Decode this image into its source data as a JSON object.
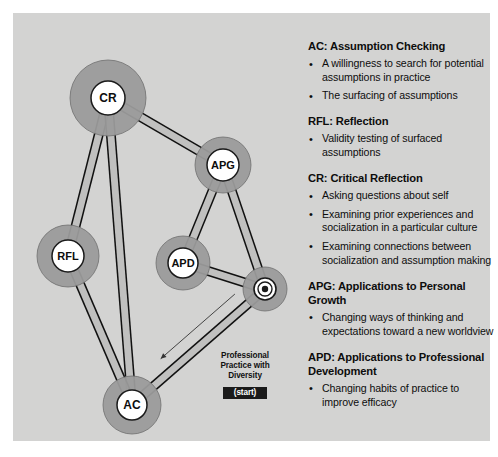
{
  "canvas": {
    "background": "#d3d3d2",
    "page_background": "#ffffff"
  },
  "colors": {
    "halo": "#9b9b9b",
    "node_fill": "#ffffff",
    "node_stroke": "#1a1a1a",
    "edge": "#111111",
    "edge_band": "#b9b9b8",
    "badge_bg": "#1a1a1a",
    "badge_text": "#ffffff",
    "text": "#0d0d0d"
  },
  "diagram": {
    "nodes": [
      {
        "id": "CR",
        "label": "CR",
        "cx": 95,
        "cy": 85,
        "halo_r": 38,
        "node_r": 17
      },
      {
        "id": "APG",
        "label": "APG",
        "cx": 210,
        "cy": 152,
        "halo_r": 28,
        "node_r": 16
      },
      {
        "id": "RFL",
        "label": "RFL",
        "cx": 55,
        "cy": 243,
        "halo_r": 31,
        "node_r": 16
      },
      {
        "id": "APD",
        "label": "APD",
        "cx": 170,
        "cy": 250,
        "halo_r": 27,
        "node_r": 15
      },
      {
        "id": "AC",
        "label": "AC",
        "cx": 119,
        "cy": 392,
        "halo_r": 29,
        "node_r": 15
      },
      {
        "id": "START",
        "label": "",
        "cx": 252,
        "cy": 276,
        "halo_r": 22,
        "node_r": 11
      }
    ],
    "edges": [
      {
        "from": "CR",
        "to": "APG"
      },
      {
        "from": "CR",
        "to": "RFL"
      },
      {
        "from": "CR",
        "to": "AC"
      },
      {
        "from": "APG",
        "to": "APD"
      },
      {
        "from": "APG",
        "to": "START"
      },
      {
        "from": "RFL",
        "to": "AC"
      },
      {
        "from": "APD",
        "to": "START"
      },
      {
        "from": "AC",
        "to": "START"
      }
    ],
    "start_marker": {
      "type": "bullseye",
      "ring_outer_r": 11,
      "ring_mid_r": 7,
      "dot_r": 3.2
    },
    "start_arrow": {
      "label_lines": [
        "Professional",
        "Practice with",
        "Diversity"
      ],
      "badge": "(start)",
      "direction": "from start node toward AC"
    }
  },
  "notes": [
    {
      "title": "AC: Assumption Checking",
      "items": [
        "A willingness to search for potential assumptions in practice",
        "The surfacing of assumptions"
      ]
    },
    {
      "title": "RFL: Reflection",
      "items": [
        "Validity testing of surfaced assumptions"
      ]
    },
    {
      "title": "CR: Critical Reflection",
      "items": [
        "Asking questions about self",
        "Examining prior experiences and socialization in a particular culture",
        "Examining connections between socialization and assumption making"
      ]
    },
    {
      "title": "APG: Applications to Personal Growth",
      "items": [
        "Changing ways of thinking and expectations toward a new worldview"
      ]
    },
    {
      "title": "APD: Applications to Professional Development",
      "items": [
        "Changing habits of practice to improve efficacy"
      ]
    }
  ]
}
